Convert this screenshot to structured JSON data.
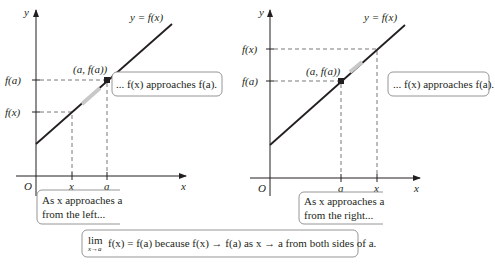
{
  "figure": {
    "left_panel": {
      "axis_labels": {
        "x": "x",
        "y": "y",
        "origin": "O"
      },
      "curve_label": "y = f(x)",
      "y_ticks": [
        "f(a)",
        "f(x)"
      ],
      "x_ticks": [
        "x",
        "a"
      ],
      "point_label": "(a, f(a))",
      "callout_top": "... f(x) approaches f(a).",
      "callout_bottom_line1": "As x approaches a",
      "callout_bottom_line2": "from the left..."
    },
    "right_panel": {
      "axis_labels": {
        "x": "x",
        "y": "y",
        "origin": "O"
      },
      "curve_label": "y = f(x)",
      "y_ticks": [
        "f(x)",
        "f(a)"
      ],
      "x_ticks": [
        "a",
        "x"
      ],
      "point_label": "(a, f(a))",
      "callout_top": "... f(x) approaches f(a).",
      "callout_bottom_line1": "As x approaches a",
      "callout_bottom_line2": "from the right..."
    },
    "summary": {
      "lim": "lim",
      "lim_sub": "x→a",
      "text": "f(x) = f(a) because f(x) → f(a) as x → a from both sides of a."
    },
    "colors": {
      "line": "#231f20",
      "highlight_arrow": "#bdbdbd",
      "box_border": "#8a8a8a"
    }
  }
}
